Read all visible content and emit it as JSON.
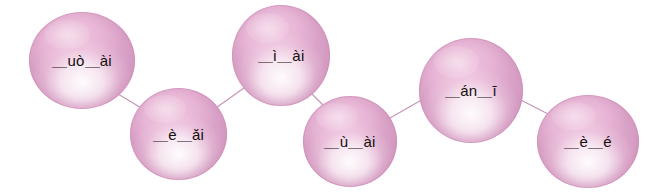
{
  "canvas": {
    "width": 654,
    "height": 196,
    "background": "#ffffff"
  },
  "style": {
    "bubble_fill_light": "#f2d2e6",
    "bubble_fill_mid": "#e4b0d2",
    "bubble_fill_dark": "#d79ec5",
    "bubble_highlight": "#ffffff",
    "bubble_rim": "#cb85b1",
    "connector_color": "#c693b5",
    "text_color": "#14100f"
  },
  "exercise": {
    "bubbles": [
      {
        "id": "bubble-1",
        "label": "＿uò＿ài",
        "x": 29,
        "y": 12,
        "w": 106,
        "h": 97,
        "font_size": 15
      },
      {
        "id": "bubble-2",
        "label": "＿è＿ǎi",
        "x": 130,
        "y": 88,
        "w": 97,
        "h": 92,
        "font_size": 15
      },
      {
        "id": "bubble-3",
        "label": "＿ì＿ài",
        "x": 232,
        "y": 5,
        "w": 98,
        "h": 101,
        "font_size": 15
      },
      {
        "id": "bubble-4",
        "label": "＿ù＿ài",
        "x": 303,
        "y": 96,
        "w": 94,
        "h": 91,
        "font_size": 15
      },
      {
        "id": "bubble-5",
        "label": "＿án＿ī",
        "x": 419,
        "y": 38,
        "w": 104,
        "h": 105,
        "font_size": 15
      },
      {
        "id": "bubble-6",
        "label": "＿è＿é",
        "x": 537,
        "y": 95,
        "w": 102,
        "h": 93,
        "font_size": 15
      }
    ],
    "connectors": [
      {
        "id": "connector-1-2",
        "from": "bubble-1",
        "to": "bubble-2",
        "x1": 118,
        "y1": 94,
        "x2": 148,
        "y2": 112
      },
      {
        "id": "connector-2-3",
        "from": "bubble-2",
        "to": "bubble-3",
        "x1": 213,
        "y1": 110,
        "x2": 244,
        "y2": 88
      },
      {
        "id": "connector-3-4",
        "from": "bubble-3",
        "to": "bubble-4",
        "x1": 310,
        "y1": 92,
        "x2": 330,
        "y2": 112
      },
      {
        "id": "connector-4-5",
        "from": "bubble-4",
        "to": "bubble-5",
        "x1": 390,
        "y1": 118,
        "x2": 432,
        "y2": 94
      },
      {
        "id": "connector-5-6",
        "from": "bubble-5",
        "to": "bubble-6",
        "x1": 513,
        "y1": 96,
        "x2": 552,
        "y2": 116
      }
    ]
  }
}
